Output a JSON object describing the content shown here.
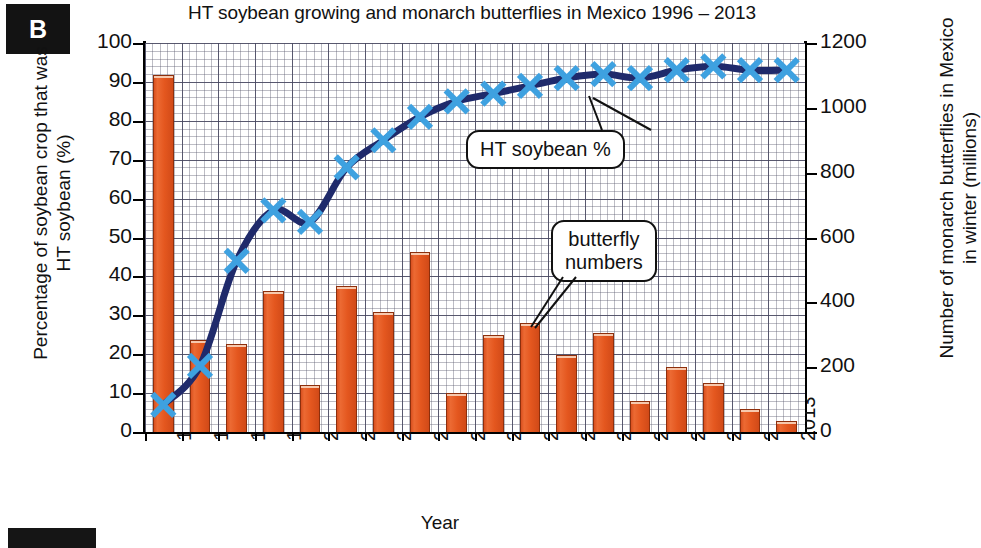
{
  "panel": {
    "letter": "B"
  },
  "chart_data": {
    "type": "bar",
    "title": "HT soybean growing and monarch butterflies in Mexico 1996 – 2013",
    "xlabel": "Year",
    "ylabel": "Percentage of soybean crop that was HT soybean (%)",
    "ylabel_right": "Number of monarch butterflies in Mexico in winter (millions)",
    "categories": [
      "1996",
      "1997",
      "1998",
      "1999",
      "2000",
      "2001",
      "2002",
      "2003",
      "2004",
      "2005",
      "2006",
      "2007",
      "2008",
      "2009",
      "2010",
      "2011",
      "2012",
      "2013"
    ],
    "ylim": [
      0,
      100
    ],
    "ylim_right": [
      0,
      1200
    ],
    "yticks": [
      "0",
      "10",
      "20",
      "30",
      "40",
      "50",
      "60",
      "70",
      "80",
      "90",
      "100"
    ],
    "yticks_right": [
      "0",
      "200",
      "400",
      "600",
      "800",
      "1000",
      "1200"
    ],
    "grid": true,
    "legend_position": "annotations",
    "series": [
      {
        "name": "butterfly numbers",
        "type": "bar",
        "axis": "right",
        "unit": "millions",
        "color": "#e0571f",
        "values": [
          1100,
          285,
          270,
          435,
          145,
          450,
          370,
          555,
          120,
          300,
          335,
          238,
          305,
          95,
          200,
          150,
          70,
          35
        ]
      },
      {
        "name": "HT soybean %",
        "type": "line",
        "axis": "left",
        "unit": "%",
        "color": "#1f2a6b",
        "marker_color": "#3ea1e0",
        "marker": "x",
        "values": [
          7,
          17,
          44,
          57,
          54,
          68,
          75,
          81,
          85,
          87,
          89,
          91,
          92,
          91,
          93,
          94,
          93,
          93
        ]
      }
    ],
    "annotations": [
      {
        "id": "ht",
        "text": "HT soybean %",
        "target_year": "2007"
      },
      {
        "id": "butterfly",
        "line1": "butterfly",
        "line2": "numbers",
        "target_year": "2006"
      }
    ]
  }
}
